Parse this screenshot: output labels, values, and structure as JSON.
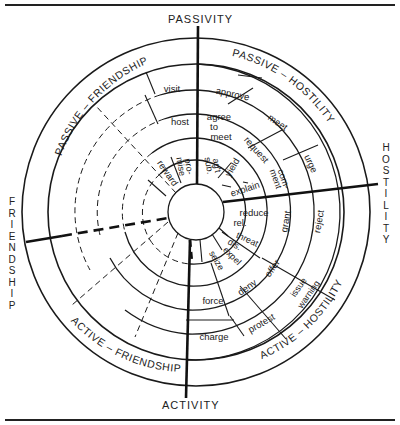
{
  "axes": {
    "top": "PASSIVITY",
    "bottom": "ACTIVITY",
    "left": "FRIENDSHIP",
    "right": "HOSTILITY"
  },
  "quadrants": {
    "passive_friendship": "PASSIVE – FRIENDSHIP",
    "passive_hostility": "PASSIVE – HOSTILITY",
    "active_friendship": "ACTIVE – FRIENDSHIP",
    "active_hostility": "ACTIVE – HOSTILITY"
  },
  "segments": {
    "visit": "visit",
    "host": "host",
    "reward": "reward",
    "promise_1": "pro-",
    "promise_2": "mise",
    "approve": "approve",
    "agree_1": "agree",
    "agree_2": "to",
    "agree_3": "meet",
    "sub_1": "sub.",
    "sub_2": "ag't",
    "meet": "meet",
    "request": "request",
    "yield": "yield",
    "urge": "urge",
    "comment_1": "com-",
    "comment_2": "ment",
    "explain": "explain",
    "reduce_1": "reduce",
    "reduce_2": "rel.",
    "grant": "grant",
    "reject": "reject",
    "threat_1": "threat",
    "threat_2": "dis.",
    "expel": "expel",
    "seize": "seize",
    "offer": "offer",
    "issue_1": "issue",
    "issue_2": "warning",
    "deny": "deny",
    "protest": "protest",
    "force": "force",
    "charge": "charge"
  },
  "colors": {
    "ink": "#1a1a1a",
    "background": "#ffffff"
  }
}
